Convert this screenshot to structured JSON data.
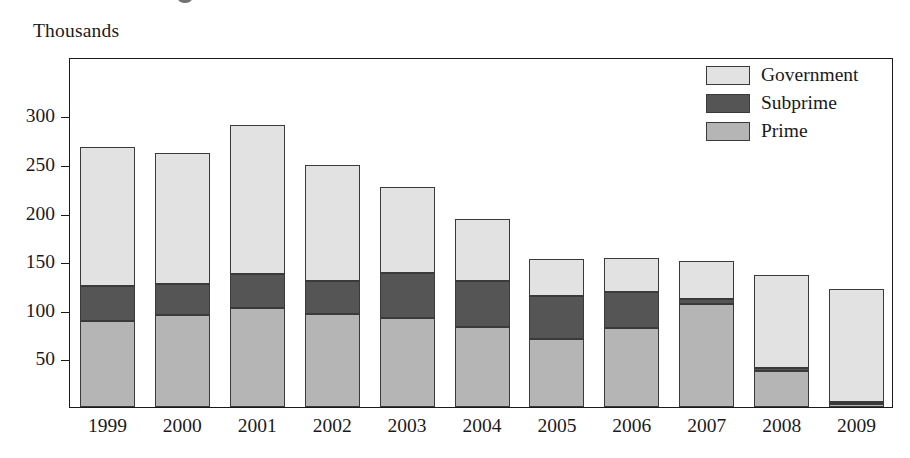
{
  "axis_unit_label": "Thousands",
  "legend": {
    "items": [
      {
        "label": "Government",
        "color": "#e2e2e2",
        "key": "government"
      },
      {
        "label": "Subprime",
        "color": "#555555",
        "key": "subprime"
      },
      {
        "label": "Prime",
        "color": "#b5b5b5",
        "key": "prime"
      }
    ]
  },
  "chart_data": {
    "type": "bar",
    "subtype": "stacked-vertical",
    "title": "",
    "subtitle": "",
    "xlabel": "",
    "ylabel": "Thousands",
    "ylim": [
      0,
      360
    ],
    "yticks": [
      50,
      100,
      150,
      200,
      250,
      300
    ],
    "ytick_labels": [
      "50",
      "100",
      "150",
      "200",
      "250",
      "300"
    ],
    "grid": false,
    "legend_position": "top-right",
    "categories": [
      "1999",
      "2000",
      "2001",
      "2002",
      "2003",
      "2004",
      "2005",
      "2006",
      "2007",
      "2008",
      "2009"
    ],
    "series": [
      {
        "name": "Prime",
        "color": "#b5b5b5",
        "values": [
          88,
          95,
          102,
          96,
          92,
          82,
          70,
          81,
          106,
          37,
          3
        ]
      },
      {
        "name": "Subprime",
        "color": "#555555",
        "values": [
          36,
          32,
          35,
          34,
          46,
          48,
          44,
          37,
          5,
          3,
          2
        ]
      },
      {
        "name": "Government",
        "color": "#e2e2e2",
        "values": [
          143,
          134,
          153,
          119,
          88,
          63,
          38,
          35,
          39,
          96,
          116
        ]
      }
    ],
    "totals": [
      267,
      261,
      290,
      249,
      226,
      193,
      152,
      153,
      150,
      136,
      121
    ]
  }
}
